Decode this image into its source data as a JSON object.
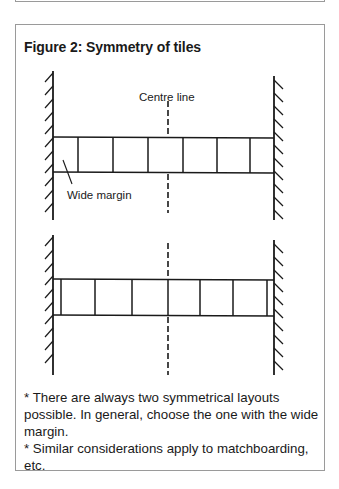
{
  "figure": {
    "title": "Figure 2: Symmetry of tiles",
    "labels": {
      "centre_line": "Centre line",
      "wide_margin": "Wide margin"
    },
    "diagrams": [
      {
        "name": "layout-wide-margin",
        "wall_left_x": 53,
        "wall_right_x": 274,
        "tile_row_top": 137,
        "tile_row_bottom": 172,
        "tile_dividers_x": [
          78,
          113,
          148,
          183,
          217,
          250
        ],
        "centre_line_x": 168,
        "centre_line_through": "tile-centre"
      },
      {
        "name": "layout-narrow-margin",
        "wall_left_x": 53,
        "wall_right_x": 274,
        "tile_row_top": 279,
        "tile_row_bottom": 315,
        "tile_dividers_x": [
          61,
          95,
          132,
          168,
          200,
          233,
          267
        ],
        "centre_line_x": 168,
        "centre_line_through": "tile-joint"
      }
    ],
    "colors": {
      "line": "#1a1a1a",
      "border": "#9a9a9a",
      "background": "#ffffff"
    }
  },
  "notes": [
    "* There are always two symmetrical layouts possible. In general, choose the one with the wide margin.",
    "* Similar considerations apply to matchboarding, etc."
  ]
}
